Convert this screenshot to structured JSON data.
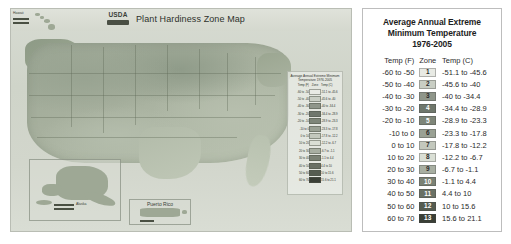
{
  "map": {
    "title": "Plant Hardiness Zone Map",
    "logo_text": "USDA",
    "logo_name": "usda-logo",
    "insets": [
      {
        "name": "alaska",
        "label": "Alaska"
      },
      {
        "name": "hawaii",
        "label": "Hawaii"
      },
      {
        "name": "puerto-rico",
        "label": "Puerto Rico"
      }
    ],
    "mini_legend": {
      "title": "Average Annual Extreme Minimum Temperature 1976-2005",
      "columns": [
        "Temp (F)",
        "Zone",
        "Temp (C)"
      ]
    }
  },
  "legend": {
    "title_line1": "Average Annual Extreme",
    "title_line2": "Minimum Temperature",
    "title_line3": "1976-2005",
    "columns": {
      "fahrenheit": "Temp (F)",
      "zone": "Zone",
      "celsius": "Temp (C)"
    },
    "rows": [
      {
        "f": "-60 to -50",
        "zone": "1",
        "c": "-51.1 to -45.6",
        "color": "#e8eae4"
      },
      {
        "f": "-50 to -40",
        "zone": "2",
        "c": "-45.6 to -40",
        "color": "#c9cec4"
      },
      {
        "f": "-40 to -30",
        "zone": "3",
        "c": "-40 to -34.4",
        "color": "#8f968a"
      },
      {
        "f": "-30 to -20",
        "zone": "4",
        "c": "-34.4 to -28.9",
        "color": "#6f776c"
      },
      {
        "f": "-20 to -10",
        "zone": "5",
        "c": "-28.9 to -23.3",
        "color": "#7e8679"
      },
      {
        "f": "-10 to 0",
        "zone": "6",
        "c": "-23.3 to -17.8",
        "color": "#9aa194"
      },
      {
        "f": "0 to 10",
        "zone": "7",
        "c": "-17.8 to -12.2",
        "color": "#c3c8bd"
      },
      {
        "f": "10 to 20",
        "zone": "8",
        "c": "-12.2 to -6.7",
        "color": "#dadfd5"
      },
      {
        "f": "20 to 30",
        "zone": "9",
        "c": "-6.7 to -1.1",
        "color": "#a8afa2"
      },
      {
        "f": "30 to 40",
        "zone": "10",
        "c": "-1.1 to 4.4",
        "color": "#7b8275"
      },
      {
        "f": "40 to 50",
        "zone": "11",
        "c": "4.4 to 10",
        "color": "#6a7165"
      },
      {
        "f": "50 to 60",
        "zone": "12",
        "c": "10 to 15.6",
        "color": "#555c50"
      },
      {
        "f": "60 to 70",
        "zone": "13",
        "c": "15.6 to 21.1",
        "color": "#3a3f36"
      }
    ]
  }
}
